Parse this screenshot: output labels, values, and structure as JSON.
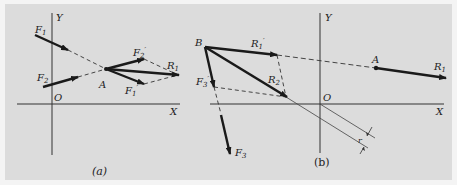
{
  "figure": {
    "background": "#dcdcdc",
    "ink": "#1a1a1a",
    "panel_a": {
      "caption": "(a)",
      "axis_labels": {
        "x": "X",
        "y": "Y",
        "origin": "O"
      },
      "forces": {
        "F1": "F",
        "F1_sub": "1",
        "F2": "F",
        "F2_sub": "2",
        "F1p": "F",
        "F1p_sub": "1",
        "F2p": "F",
        "F2p_sub": "2",
        "R1": "R",
        "R1_sub": "1"
      },
      "point": "A",
      "prime": "′"
    },
    "panel_b": {
      "caption": "(b)",
      "axis_labels": {
        "x": "X",
        "y": "Y",
        "origin": "O"
      },
      "forces": {
        "R1p": "R",
        "R1p_sub": "1",
        "R2": "R",
        "R2_sub": "2",
        "F3p": "F",
        "F3p_sub": "3",
        "F3": "F",
        "F3_sub": "3",
        "R1": "R",
        "R1_sub": "1"
      },
      "points": {
        "B": "B",
        "A": "A"
      },
      "distance_label": "r",
      "prime": "′"
    }
  }
}
